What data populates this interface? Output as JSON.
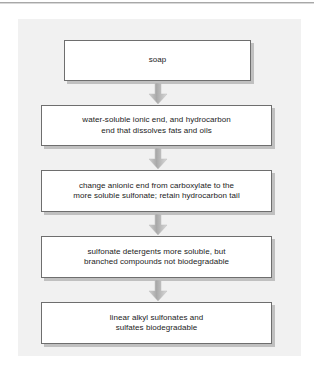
{
  "figure": {
    "type": "flowchart",
    "orientation": "vertical-top-to-bottom",
    "panel_color": "#f1f1f1",
    "box_fill": "#ffffff",
    "box_border": "#6e6e6e",
    "arrow_color": "#b3b3b3",
    "nodes": [
      {
        "id": "node-1",
        "text": "soap"
      },
      {
        "id": "node-2",
        "line1": "water-soluble ionic end, and hydrocarbon",
        "line2": "end that dissolves fats and oils"
      },
      {
        "id": "node-3",
        "line1": "change anionic end from carboxylate to the",
        "line2": "more soluble sulfonate; retain hydrocarbon tail"
      },
      {
        "id": "node-4",
        "line1": "sulfonate detergents more soluble, but",
        "line2": "branched compounds not biodegradable"
      },
      {
        "id": "node-5",
        "line1": "linear alkyl sulfonates and",
        "line2": "sulfates biodegradable"
      }
    ],
    "connectors": [
      {
        "id": "arrow-1",
        "from": "node-1",
        "to": "node-2",
        "glyph": "down-arrow"
      },
      {
        "id": "arrow-2",
        "from": "node-2",
        "to": "node-3",
        "glyph": "down-arrow"
      },
      {
        "id": "arrow-3",
        "from": "node-3",
        "to": "node-4",
        "glyph": "down-arrow"
      },
      {
        "id": "arrow-4",
        "from": "node-4",
        "to": "node-5",
        "glyph": "down-arrow"
      }
    ]
  }
}
